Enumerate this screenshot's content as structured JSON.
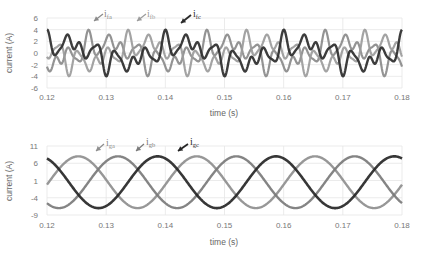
{
  "chart_data": [
    {
      "type": "line",
      "title": "",
      "xlabel": "time (s)",
      "ylabel": "current (A)",
      "xlim": [
        0.12,
        0.18
      ],
      "ylim": [
        -6,
        6
      ],
      "xticks": [
        "0.12",
        "0.13",
        "0.14",
        "0.15",
        "0.16",
        "0.17",
        "0.18"
      ],
      "yticks": [
        "6",
        "4",
        "2",
        "0",
        "-2",
        "-4",
        "-6"
      ],
      "grid": true,
      "legend": "inline annotations with arrows",
      "frequency_hz": 50,
      "series": [
        {
          "name": "i_fa",
          "label_main": "i",
          "label_sub": "fa",
          "color": "#8a8a8a",
          "width": 2.2,
          "phase_deg": 0,
          "peak_time_s": 0.127,
          "peak_value": 4.5,
          "min_value": -4.8
        },
        {
          "name": "i_fb",
          "label_main": "i",
          "label_sub": "fb",
          "color": "#9b9b9b",
          "width": 2.2,
          "phase_deg": -120,
          "peak_time_s": 0.1337,
          "peak_value": 4.5,
          "min_value": -4.8
        },
        {
          "name": "i_fc",
          "label_main": "i",
          "label_sub": "fc",
          "color": "#2b2b2b",
          "width": 2.4,
          "phase_deg": 120,
          "peak_time_s": 0.14,
          "peak_value": 4.5,
          "min_value": -4.8
        }
      ]
    },
    {
      "type": "line",
      "title": "",
      "xlabel": "time (s)",
      "ylabel": "current (A)",
      "xlim": [
        0.12,
        0.18
      ],
      "ylim": [
        -9,
        11
      ],
      "xticks": [
        "0.12",
        "0.13",
        "0.14",
        "0.15",
        "0.16",
        "0.17",
        "0.18"
      ],
      "yticks": [
        "11",
        "6",
        "1",
        "-4",
        "-9"
      ],
      "grid": true,
      "legend": "inline annotations with arrows",
      "frequency_hz": 50,
      "series": [
        {
          "name": "i_ga",
          "label_main": "i",
          "label_sub": "ga",
          "color": "#8e8e8e",
          "width": 2.4,
          "amplitude": 7.5,
          "peak_time_s": 0.1253
        },
        {
          "name": "i_gb",
          "label_main": "i",
          "label_sub": "gb",
          "color": "#7a7a7a",
          "width": 2.4,
          "amplitude": 7.5,
          "peak_time_s": 0.132
        },
        {
          "name": "i_gc",
          "label_main": "i",
          "label_sub": "gc",
          "color": "#262626",
          "width": 2.6,
          "amplitude": 7.5,
          "peak_time_s": 0.1387
        }
      ]
    }
  ]
}
